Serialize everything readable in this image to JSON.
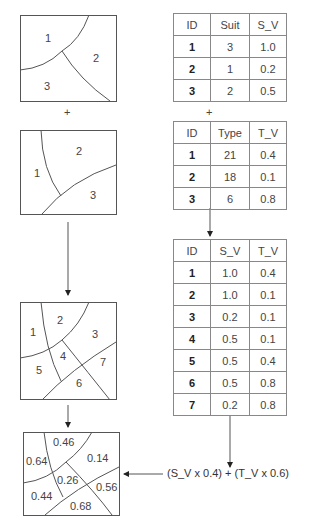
{
  "plus_sign": "+",
  "map1": {
    "regions": [
      "1",
      "2",
      "3"
    ]
  },
  "map2": {
    "regions": [
      "1",
      "2",
      "3"
    ]
  },
  "map3": {
    "regions": [
      "1",
      "2",
      "3",
      "4",
      "5",
      "6",
      "7"
    ]
  },
  "map4": {
    "values": [
      "0.64",
      "0.46",
      "0.14",
      "0.26",
      "0.44",
      "0.56",
      "0.68"
    ]
  },
  "table_suit": {
    "headers": [
      "ID",
      "Suit",
      "S_V"
    ],
    "rows": [
      [
        "1",
        "3",
        "1.0"
      ],
      [
        "2",
        "1",
        "0.2"
      ],
      [
        "3",
        "2",
        "0.5"
      ]
    ]
  },
  "table_type": {
    "headers": [
      "ID",
      "Type",
      "T_V"
    ],
    "rows": [
      [
        "1",
        "21",
        "0.4"
      ],
      [
        "2",
        "18",
        "0.1"
      ],
      [
        "3",
        "6",
        "0.8"
      ]
    ]
  },
  "table_combined": {
    "headers": [
      "ID",
      "S_V",
      "T_V"
    ],
    "rows": [
      [
        "1",
        "1.0",
        "0.4"
      ],
      [
        "2",
        "1.0",
        "0.1"
      ],
      [
        "3",
        "0.2",
        "0.1"
      ],
      [
        "4",
        "0.5",
        "0.1"
      ],
      [
        "5",
        "0.5",
        "0.4"
      ],
      [
        "6",
        "0.5",
        "0.8"
      ],
      [
        "7",
        "0.2",
        "0.8"
      ]
    ]
  },
  "formula": "(S_V x 0.4) + (T_V x 0.6)"
}
